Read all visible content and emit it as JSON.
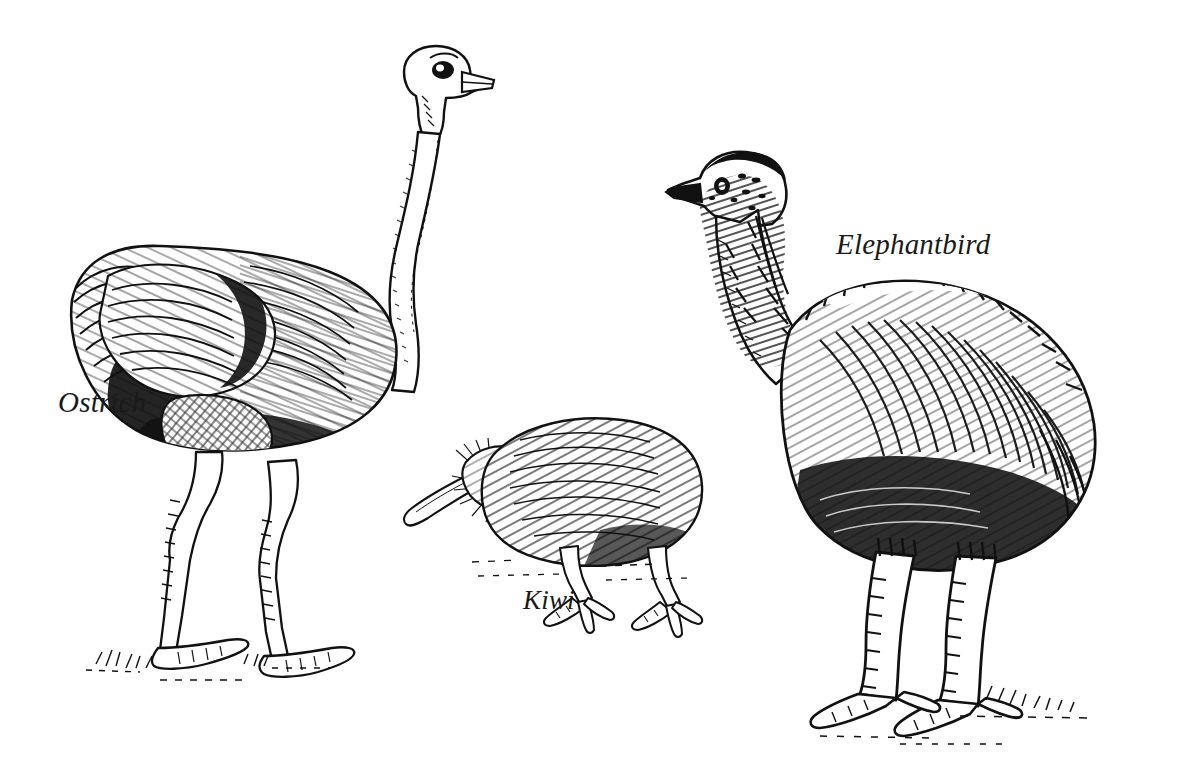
{
  "figure": {
    "kind": "scientific-line-illustration",
    "technique": "pen-and-ink hatching",
    "background_color": "#ffffff",
    "ink_color": "#111111",
    "width": 1194,
    "height": 763
  },
  "labels": {
    "ostrich": "Ostrich",
    "kiwi": "Kiwi",
    "elephantbird": "Elephantbird"
  },
  "specimens": [
    {
      "name": "Ostrich",
      "label": "Ostrich",
      "position": "left",
      "facing": "right",
      "relative_size": "tall",
      "features": "long slender S-curved neck, small head with large eye, short pointed beak, bulky hatched body plumage, very long thin two-toed legs"
    },
    {
      "name": "Kiwi",
      "label": "Kiwi",
      "position": "center",
      "facing": "left",
      "relative_size": "small",
      "features": "long downcurved probing bill, facial whiskers, rounded hair-like plumage body, short stout three-toed legs"
    },
    {
      "name": "Elephantbird",
      "label": "Elephantbird",
      "position": "right",
      "facing": "left",
      "relative_size": "massive",
      "features": "shaggy hair-like plumage, bristly maned neck, small head with short beak, very thick heavy scaled legs"
    }
  ],
  "ground": {
    "style": "sparse grass tufts and dashed ground lines beneath each bird"
  }
}
